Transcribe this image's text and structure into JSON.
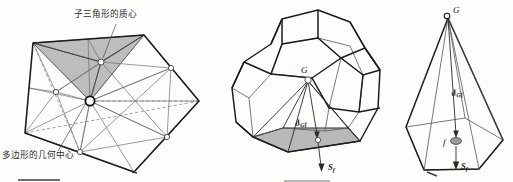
{
  "figure": {
    "title_semantic": "polygon-and-polyhedron-centroid-decomposition",
    "background_color": "#fdfdfc",
    "ink_color": "#1c1c1c",
    "shade_color": "#a3a3a3"
  },
  "panels": [
    {
      "id": "left",
      "name": "polygon-subtriangle-decomposition",
      "annotations": [
        {
          "key": "subtriangle_centroid",
          "text": "子三角形的质心",
          "x": 74,
          "y": 17,
          "leader_from": [
            118,
            22
          ],
          "leader_to": [
            101,
            62
          ]
        },
        {
          "key": "polygon_geometric_center",
          "text": "多边形的几何中心",
          "x": 2,
          "y": 158,
          "leader_from": [
            58,
            151
          ],
          "leader_to": [
            90,
            101
          ]
        }
      ],
      "markers": [
        {
          "key": "polygon-center-node",
          "x": 90,
          "y": 101,
          "r": 4.6,
          "style": "bold-circle"
        },
        {
          "key": "subtriangle-centroid-node",
          "x": 101,
          "y": 62,
          "r": 3.0,
          "style": "circle"
        }
      ],
      "polygon_vertices": [
        [
          33,
          43
        ],
        [
          144,
          35
        ],
        [
          199,
          101
        ],
        [
          134,
          172
        ],
        [
          25,
          133
        ]
      ],
      "shaded_subtriangle": [
        [
          33,
          43
        ],
        [
          144,
          35
        ],
        [
          90,
          101
        ]
      ]
    },
    {
      "id": "middle",
      "name": "dodecahedron-centroid-to-face",
      "labels": [
        {
          "key": "centroid-G",
          "text": "G",
          "x": 301,
          "y": 70,
          "italic": true
        },
        {
          "key": "distance-d-Gf",
          "base": "d",
          "sub": "Gf",
          "x": 296,
          "y": 126
        },
        {
          "key": "face-normal-S-f",
          "base": "S",
          "sub": "f",
          "x": 328,
          "y": 167
        }
      ],
      "markers": [
        {
          "key": "centroid-node",
          "x": 308,
          "y": 79,
          "r": 3.2
        },
        {
          "key": "face-centroid-node",
          "x": 318,
          "y": 140,
          "r": 2.6
        }
      ]
    },
    {
      "id": "right",
      "name": "pyramid-G-over-face-f",
      "labels": [
        {
          "key": "apex-G",
          "text": "G",
          "x": 453,
          "y": 12,
          "italic": true
        },
        {
          "key": "distance-d-Gf",
          "base": "d",
          "sub": "Gf",
          "x": 452,
          "y": 96
        },
        {
          "key": "face-f",
          "text": "f",
          "x": 446,
          "y": 142,
          "italic": true
        },
        {
          "key": "face-normal-S-f",
          "base": "S",
          "sub": "f",
          "x": 460,
          "y": 165
        }
      ],
      "markers": [
        {
          "key": "apex-node",
          "x": 448,
          "y": 15,
          "r": 2.8
        },
        {
          "key": "face-centroid-ellipse",
          "x": 456,
          "y": 141,
          "rx": 5.5,
          "ry": 3.4
        }
      ]
    }
  ],
  "glyphs": {
    "G": "G",
    "d": "d",
    "S": "S",
    "f": "f",
    "sub_Gf": "Gf",
    "sub_f": "f"
  },
  "scan_artifacts": [
    {
      "key": "rule-left",
      "x1": 18,
      "y1": 180,
      "x2": 60,
      "y2": 180,
      "tone": "dark"
    },
    {
      "key": "rule-mid",
      "x1": 284,
      "y1": 181,
      "x2": 330,
      "y2": 181,
      "tone": "light"
    },
    {
      "key": "tick-top",
      "x1": 133,
      "y1": 172,
      "x2": 136,
      "y2": 173,
      "tone": "dark"
    },
    {
      "key": "tick-right",
      "x1": 428,
      "y1": 172,
      "x2": 436,
      "y2": 175,
      "tone": "dark"
    }
  ]
}
